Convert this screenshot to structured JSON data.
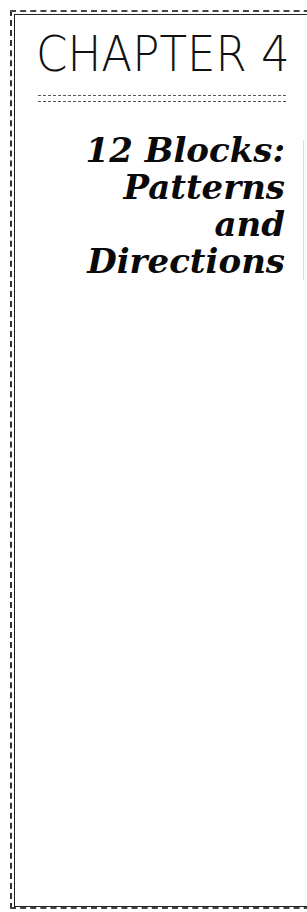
{
  "chapter": {
    "label": "CHAPTER 4"
  },
  "title": {
    "lines": [
      "12 Blocks:",
      "Patterns",
      "and",
      "Directions"
    ]
  },
  "colors": {
    "ink": "#111111",
    "background": "#ffffff",
    "frame": "#333333"
  }
}
